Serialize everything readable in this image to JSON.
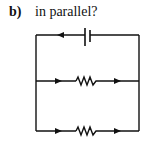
{
  "question": {
    "part_label": "b)",
    "text": "in parallel?"
  },
  "diagram": {
    "type": "parallel-circuit",
    "components": [
      {
        "name": "battery",
        "branch": "top"
      },
      {
        "name": "resistor",
        "branch": "middle"
      },
      {
        "name": "resistor",
        "branch": "bottom"
      }
    ],
    "current_arrows": {
      "top": "left",
      "middle": [
        "right",
        "right"
      ],
      "bottom": [
        "right",
        "right"
      ]
    },
    "stroke_color": "#111111"
  }
}
